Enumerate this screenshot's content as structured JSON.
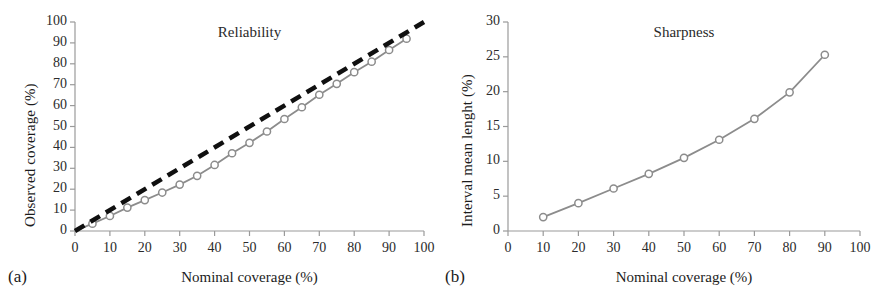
{
  "figure": {
    "background": "#ffffff",
    "series_color": "#8c8c8c",
    "reference_color": "#101010",
    "marker_fill": "#ffffff",
    "axis_color": "#9a9a9a",
    "text_color": "#1c1c1c"
  },
  "panels": [
    {
      "id": "a",
      "panel_label": "(a)",
      "title": "Reliability",
      "chart_data": {
        "type": "line",
        "title": "Reliability",
        "xlabel": "Nominal coverage (%)",
        "ylabel": "Observed coverage (%)",
        "xlim": [
          0,
          100
        ],
        "ylim": [
          0,
          100
        ],
        "xticks": [
          0,
          10,
          20,
          30,
          40,
          50,
          60,
          70,
          80,
          90,
          100
        ],
        "yticks": [
          0,
          10,
          20,
          30,
          40,
          50,
          60,
          70,
          80,
          90,
          100
        ],
        "grid": false,
        "legend": "none",
        "series": [
          {
            "name": "Observed coverage",
            "style": "solid-with-open-circle-markers",
            "color": "#8c8c8c",
            "x": [
              0,
              5,
              10,
              15,
              20,
              25,
              30,
              35,
              40,
              45,
              50,
              55,
              60,
              65,
              70,
              75,
              80,
              85,
              90,
              95
            ],
            "values": [
              0,
              3.5,
              7.2,
              11.2,
              14.8,
              18.4,
              22.2,
              26.4,
              31.6,
              37.2,
              42.2,
              47.6,
              53.6,
              59.2,
              65.2,
              70.4,
              76.0,
              81.0,
              86.6,
              92.0
            ]
          },
          {
            "name": "1:1 reference",
            "style": "dashed",
            "color": "#101010",
            "x": [
              0,
              100
            ],
            "values": [
              0,
              100
            ]
          }
        ]
      }
    },
    {
      "id": "b",
      "panel_label": "(b)",
      "title": "Sharpness",
      "chart_data": {
        "type": "line",
        "title": "Sharpness",
        "xlabel": "Nominal coverage (%)",
        "ylabel": "Interval mean lenght (%)",
        "xlim": [
          0,
          100
        ],
        "ylim": [
          0,
          30
        ],
        "xticks": [
          0,
          10,
          20,
          30,
          40,
          50,
          60,
          70,
          80,
          90,
          100
        ],
        "yticks": [
          0,
          5,
          10,
          15,
          20,
          25,
          30
        ],
        "grid": false,
        "legend": "none",
        "series": [
          {
            "name": "Interval mean lenght",
            "style": "solid-with-open-circle-markers",
            "color": "#8c8c8c",
            "x": [
              10,
              20,
              30,
              40,
              50,
              60,
              70,
              80,
              90
            ],
            "values": [
              2.0,
              4.0,
              6.1,
              8.2,
              10.5,
              13.1,
              16.1,
              19.9,
              25.3
            ]
          }
        ]
      }
    }
  ]
}
